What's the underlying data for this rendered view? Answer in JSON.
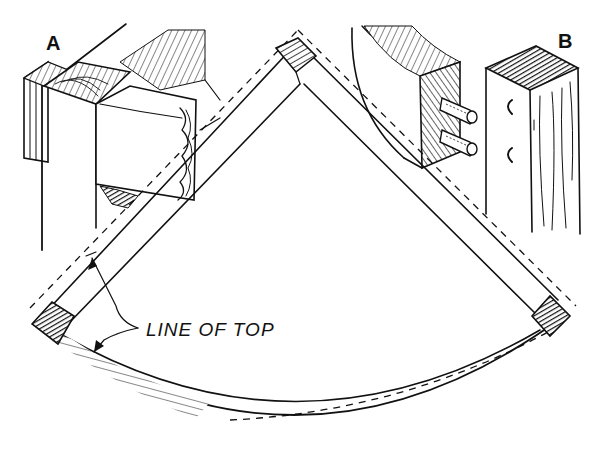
{
  "figure": {
    "labels": {
      "detail_a": "A",
      "detail_b": "B",
      "annotation": "LINE OF TOP"
    },
    "colors": {
      "ink": "#111111",
      "paper": "#ffffff"
    },
    "parts": [
      "detail-a-corner-joint",
      "detail-b-dowel-joint",
      "quarter-circle-frame",
      "top-corner-block",
      "left-corner-block",
      "right-corner-block",
      "curved-front-rail"
    ]
  }
}
